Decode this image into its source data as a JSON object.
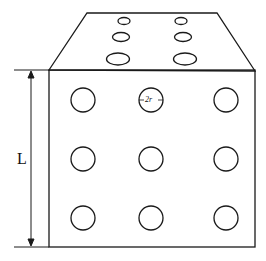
{
  "diagram": {
    "labels": {
      "length": "L",
      "hole_diameter": "2r"
    },
    "front_face": {
      "rows": 3,
      "cols": 3,
      "holes": 9
    },
    "top_face": {
      "rows": 3,
      "cols": 2,
      "holes": 6
    },
    "colors": {
      "stroke": "#1a1a1a",
      "background": "#ffffff"
    }
  }
}
